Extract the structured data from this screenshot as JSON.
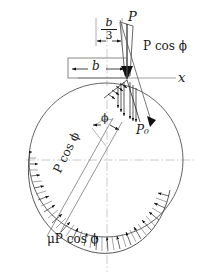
{
  "figure": {
    "labels": {
      "load_P": "P",
      "axis_x": "x",
      "width_b": "b",
      "eccentricity_num": "b",
      "eccentricity_den": "3",
      "angle_phi": "ϕ",
      "pressure_P0": "P₀",
      "normal_component": "P cos ϕ",
      "radial_component": "P cos ϕ",
      "friction_component": "μP cos ϕ"
    },
    "colors": {
      "line": "#1a1a1a",
      "circle": "#4a4a4a",
      "centerline": "#bdbdbd",
      "background": "#ffffff",
      "arrow_fill": "#111111"
    },
    "geometry": {
      "circle_center_x": 106,
      "circle_center_y": 160,
      "circle_radius": 77,
      "contact_point_x": 127,
      "contact_point_y": 78,
      "axis_y": 78,
      "vertical_centerline_x": 107,
      "horizontal_centerline_y": 160
    }
  }
}
